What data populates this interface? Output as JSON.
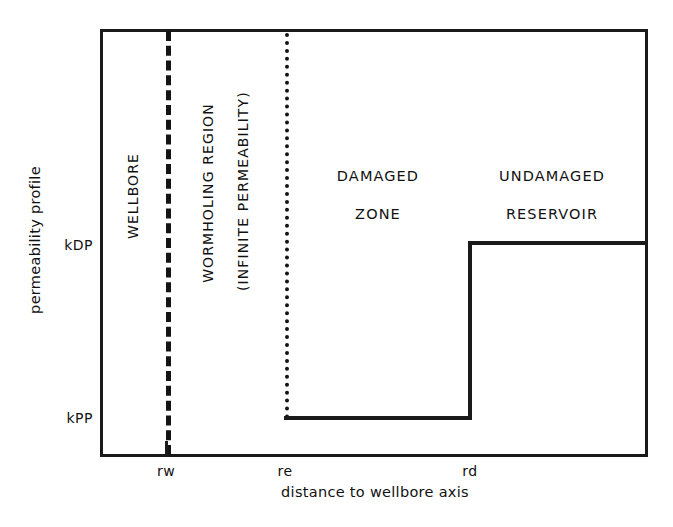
{
  "chart_data": {
    "type": "line",
    "title": "",
    "xlabel": "distance to wellbore axis",
    "ylabel": "permeability profile",
    "x_ticks": [
      "rw",
      "re",
      "rd"
    ],
    "y_ticks": [
      "kPP",
      "kDP"
    ],
    "grid": false,
    "legend": "none",
    "series": [
      {
        "name": "permeability profile",
        "x": [
          "re",
          "rd",
          "rd",
          "right_edge"
        ],
        "y": [
          "kPP",
          "kPP",
          "kDP",
          "kDP"
        ],
        "style": "solid-step"
      }
    ],
    "markers": [
      {
        "name": "wellbore-wall",
        "x": "rw",
        "style": "dashed-vertical"
      },
      {
        "name": "wormhole-front",
        "x": "re",
        "style": "dotted-vertical"
      }
    ],
    "annotations": [
      {
        "name": "wellbore",
        "text": "WELLBORE",
        "orientation": "vertical"
      },
      {
        "name": "wormholing-region",
        "text": "WORMHOLING REGION",
        "orientation": "vertical"
      },
      {
        "name": "infinite-permeability",
        "text": "(INFINITE PERMEABILITY)",
        "orientation": "vertical"
      },
      {
        "name": "damaged-zone",
        "text": "DAMAGED ZONE",
        "orientation": "horizontal"
      },
      {
        "name": "undamaged-reservoir",
        "text": "UNDAMAGED RESERVOIR",
        "orientation": "horizontal"
      }
    ]
  },
  "axes": {
    "y_title": "permeability profile",
    "x_title": "distance to wellbore axis",
    "y_tick_high": "kDP",
    "y_tick_low": "kPP",
    "x_tick_wellbore": "rw",
    "x_tick_wormhole": "re",
    "x_tick_damage": "rd"
  },
  "regions": {
    "wellbore": "WELLBORE",
    "wormholing_line1": "WORMHOLING REGION",
    "wormholing_line2": "(INFINITE PERMEABILITY)",
    "damaged_line1": "DAMAGED",
    "damaged_line2": "ZONE",
    "undamaged_line1": "UNDAMAGED",
    "undamaged_line2": "RESERVOIR"
  },
  "colors": {
    "ink": "#1a1a1a",
    "background": "#ffffff"
  }
}
